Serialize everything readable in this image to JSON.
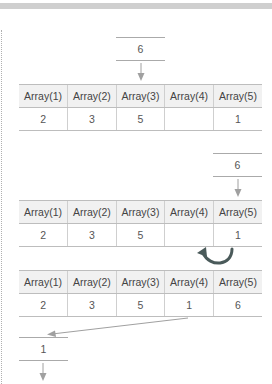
{
  "headers": [
    "Array(1)",
    "Array(2)",
    "Array(3)",
    "Array(4)",
    "Array(5)"
  ],
  "step1": {
    "incoming_value": "6",
    "row": [
      "2",
      "3",
      "5",
      "",
      "1"
    ]
  },
  "step2": {
    "incoming_value": "6",
    "row": [
      "2",
      "3",
      "5",
      "",
      "1"
    ],
    "swap_arrow": "curved-arrow-left"
  },
  "step3": {
    "row": [
      "2",
      "3",
      "5",
      "1",
      "6"
    ],
    "outgoing_value": "1"
  },
  "colors": {
    "header_bg": "#f1f1f1",
    "line": "#bdbdbd",
    "arrow": "#9a9a9a",
    "curved_arrow": "#4a5a5a"
  }
}
